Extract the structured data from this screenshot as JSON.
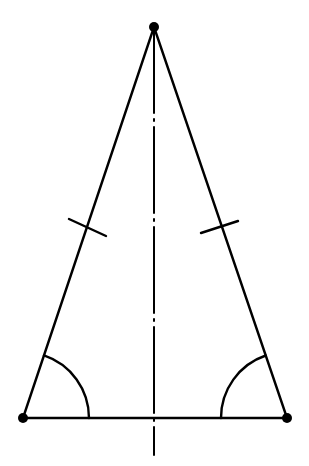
{
  "diagram": {
    "width": 309,
    "height": 466,
    "colors": {
      "stroke": "#000000",
      "background": "#ffffff"
    },
    "vertices": {
      "apex": {
        "x": 154,
        "y": 27
      },
      "base_left": {
        "x": 23,
        "y": 418
      },
      "base_right": {
        "x": 287,
        "y": 418
      }
    },
    "vertex_dot_radius": 5,
    "edge_stroke_width": 2.4,
    "axis_of_symmetry": {
      "x": 154,
      "y_start": 27,
      "y_end": 455,
      "style": "dash-dot",
      "dash_pattern": "86 6 2 6"
    },
    "congruent_side_ticks": [
      {
        "side": "left",
        "x1": 69,
        "y1": 219,
        "x2": 106,
        "y2": 236
      },
      {
        "side": "right",
        "x1": 201,
        "y1": 233,
        "x2": 238,
        "y2": 221
      }
    ],
    "angle_arcs": [
      {
        "vertex": "base_left",
        "radius": 66,
        "label": ""
      },
      {
        "vertex": "base_right",
        "radius": 66,
        "label": ""
      }
    ]
  }
}
